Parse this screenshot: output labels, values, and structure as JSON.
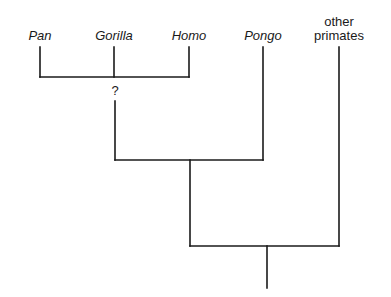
{
  "diagram": {
    "type": "cladogram",
    "taxa": [
      {
        "id": "pan",
        "label": "Pan",
        "italic": true
      },
      {
        "id": "gorilla",
        "label": "Gorilla",
        "italic": true
      },
      {
        "id": "homo",
        "label": "Homo",
        "italic": true
      },
      {
        "id": "pongo",
        "label": "Pongo",
        "italic": true
      },
      {
        "id": "other",
        "label_line1": "other",
        "label_line2": "primates",
        "italic": false
      }
    ],
    "uncertain_node_label": "?",
    "line_color": "#1a1a1a",
    "structure": "((Pan, Gorilla, Homo)?, Pongo), other primates"
  }
}
